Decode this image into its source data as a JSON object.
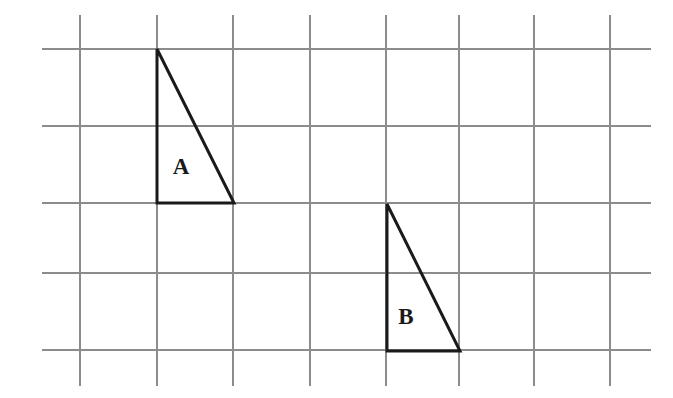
{
  "figure": {
    "type": "geometry-diagram",
    "width": 673,
    "height": 398,
    "background_color": "#ffffff"
  },
  "grid": {
    "name": "square-grid",
    "line_color": "#8c8c8c",
    "line_width": 1.1,
    "cell_size": 76,
    "vertical_lines_x": [
      80,
      157,
      233,
      310,
      386,
      459,
      534,
      610
    ],
    "horizontal_lines_y": [
      49,
      126,
      203,
      273,
      350
    ],
    "vertical_extent_y": [
      15,
      386
    ],
    "horizontal_extent_x": [
      42,
      651
    ],
    "columns": 7,
    "rows": 4
  },
  "shapes": [
    {
      "id": "triangle-a",
      "label": "A",
      "kind": "right-triangle",
      "stroke_color": "#1a1a1a",
      "stroke_width": 3,
      "vertices": [
        {
          "name": "apex",
          "x": 157,
          "y": 49
        },
        {
          "name": "right-angle",
          "x": 157,
          "y": 203
        },
        {
          "name": "base-right",
          "x": 234,
          "y": 203
        }
      ],
      "points_attr": "157,49 157,203 234,203",
      "label_position": {
        "x": 181,
        "y": 169
      },
      "legs": {
        "vertical": 154,
        "horizontal": 77
      }
    },
    {
      "id": "triangle-b",
      "label": "B",
      "kind": "right-triangle",
      "stroke_color": "#1a1a1a",
      "stroke_width": 3,
      "vertices": [
        {
          "name": "apex",
          "x": 387,
          "y": 204
        },
        {
          "name": "right-angle",
          "x": 387,
          "y": 351
        },
        {
          "name": "base-right",
          "x": 460,
          "y": 351
        }
      ],
      "points_attr": "387,204 387,351 460,351",
      "label_position": {
        "x": 406,
        "y": 319
      },
      "legs": {
        "vertical": 147,
        "horizontal": 73
      }
    }
  ],
  "chart_data": {
    "type": "scatter",
    "xlabel": "",
    "ylabel": "",
    "grid": true,
    "series": [
      {
        "name": "A",
        "x": [
          157,
          157,
          234,
          157
        ],
        "y": [
          49,
          203,
          203,
          49
        ]
      },
      {
        "name": "B",
        "x": [
          387,
          387,
          460,
          387
        ],
        "y": [
          204,
          351,
          351,
          204
        ]
      }
    ]
  }
}
